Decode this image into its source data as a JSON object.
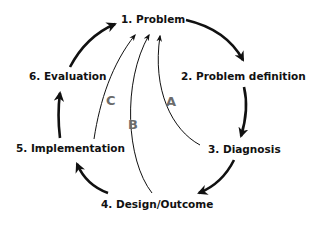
{
  "diagram": {
    "type": "cycle",
    "steps": [
      {
        "id": "1",
        "label": "1. Problem"
      },
      {
        "id": "2",
        "label": "2. Problem definition"
      },
      {
        "id": "3",
        "label": "3. Diagnosis"
      },
      {
        "id": "4",
        "label": "4. Design/Outcome"
      },
      {
        "id": "5",
        "label": "5. Implementation"
      },
      {
        "id": "6",
        "label": "6. Evaluation"
      }
    ],
    "cycle_edges": [
      {
        "from": "1",
        "to": "2"
      },
      {
        "from": "2",
        "to": "3"
      },
      {
        "from": "3",
        "to": "4"
      },
      {
        "from": "4",
        "to": "5"
      },
      {
        "from": "5",
        "to": "6"
      },
      {
        "from": "6",
        "to": "1"
      }
    ],
    "feedback_loops": [
      {
        "label": "A",
        "from": "3",
        "to": "1"
      },
      {
        "label": "B",
        "from": "4",
        "to": "1"
      },
      {
        "label": "C",
        "from": "5",
        "to": "1"
      }
    ],
    "colors": {
      "stroke": "#111111",
      "text": "#111111",
      "loop_label": "#6b6b6b",
      "background": "#ffffff"
    }
  }
}
